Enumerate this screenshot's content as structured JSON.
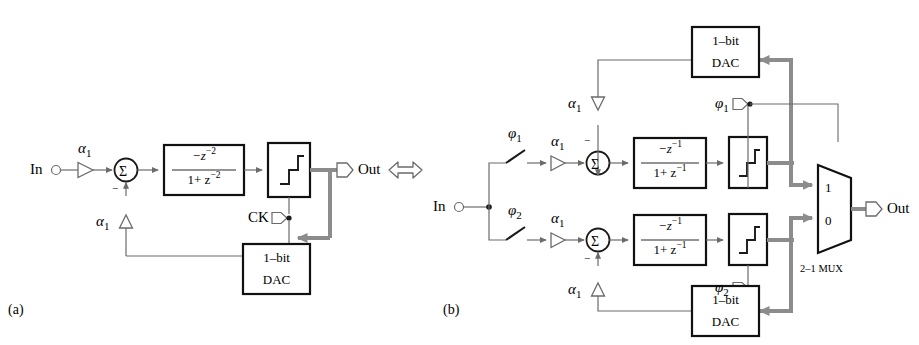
{
  "figure": {
    "equivalence_symbol": "double-headed-arrow",
    "panels": [
      {
        "id": "a",
        "label": "(a)"
      },
      {
        "id": "b",
        "label": "(b)"
      }
    ]
  },
  "colors": {
    "line": "#6b6b6b",
    "line_dark": "#1a1a1a",
    "signal_bold": "#8c8c8c",
    "text": "#2b2b2b",
    "block_stroke": "#111111",
    "background": "#ffffff"
  },
  "panel_a": {
    "label": "(a)",
    "input_port": {
      "label": "In",
      "symbol": "open-circle"
    },
    "output_port": {
      "label": "Out",
      "symbol": "pentagon-port"
    },
    "input_gain": {
      "label": "α",
      "subscript": "1"
    },
    "feedback_gain": {
      "label": "α",
      "subscript": "1"
    },
    "summing_node": {
      "symbol": "Σ",
      "negative_sign": "−"
    },
    "loop_filter": {
      "numerator": "−z",
      "numerator_exp": "−2",
      "denominator_lead": "1+ z",
      "denominator_exp": "−2"
    },
    "quantizer": {
      "symbol": "step-function",
      "name": "quantizer"
    },
    "clock": {
      "label": "CK",
      "symbol": "pentagon-port"
    },
    "dac": {
      "line1": "1–bit",
      "line2": "DAC"
    }
  },
  "panel_b": {
    "label": "(b)",
    "input_port": {
      "label": "In",
      "symbol": "open-circle"
    },
    "output_port": {
      "label": "Out",
      "symbol": "pentagon-port"
    },
    "mux": {
      "input_top": "1",
      "input_bottom": "0",
      "label": "2–1 MUX"
    },
    "paths": [
      {
        "id": "top",
        "switch": {
          "label": "φ",
          "subscript": "1"
        },
        "input_gain": {
          "label": "α",
          "subscript": "1"
        },
        "feedback_gain": {
          "label": "α",
          "subscript": "1"
        },
        "summing_node": {
          "symbol": "Σ",
          "negative_sign": "−"
        },
        "loop_filter": {
          "numerator": "−z",
          "numerator_exp": "−1",
          "denominator_lead": "1+ z",
          "denominator_exp": "−1"
        },
        "quantizer": {
          "symbol": "step-function",
          "name": "quantizer"
        },
        "clock": {
          "label": "φ",
          "subscript": "1",
          "symbol": "pentagon-port"
        },
        "dac": {
          "line1": "1–bit",
          "line2": "DAC"
        }
      },
      {
        "id": "bottom",
        "switch": {
          "label": "φ",
          "subscript": "2"
        },
        "input_gain": {
          "label": "α",
          "subscript": "1"
        },
        "feedback_gain": {
          "label": "α",
          "subscript": "1"
        },
        "summing_node": {
          "symbol": "Σ",
          "negative_sign": "−"
        },
        "loop_filter": {
          "numerator": "−z",
          "numerator_exp": "−1",
          "denominator_lead": "1+ z",
          "denominator_exp": "−1"
        },
        "quantizer": {
          "symbol": "step-function",
          "name": "quantizer"
        },
        "clock": {
          "label": "φ",
          "subscript": "2",
          "symbol": "pentagon-port"
        },
        "dac": {
          "line1": "1–bit",
          "line2": "DAC"
        }
      }
    ]
  }
}
